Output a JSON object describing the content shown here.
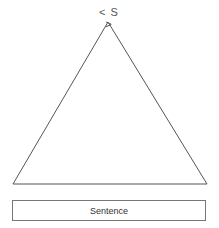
{
  "diagram": {
    "root_label": "< S >",
    "leaf_label": "Sentence",
    "stroke_color": "#555555"
  }
}
